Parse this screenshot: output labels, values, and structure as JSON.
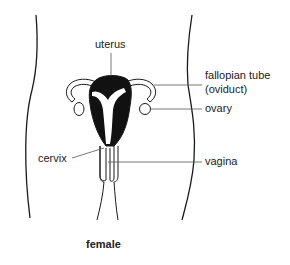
{
  "diagram": {
    "title": "female",
    "labels": {
      "uterus": "uterus",
      "fallopian_tube": "fallopian tube",
      "fallopian_tube_alt": "(oviduct)",
      "ovary": "ovary",
      "cervix": "cervix",
      "vagina": "vagina"
    },
    "colors": {
      "ink": "#1a1a1a",
      "fill": "#111111",
      "leader": "#555555",
      "background": "#ffffff"
    }
  }
}
